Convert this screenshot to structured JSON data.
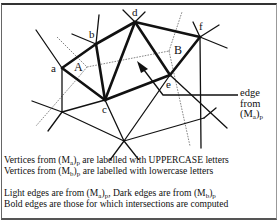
{
  "diagram": {
    "vertices_lowercase": [
      {
        "label": "a",
        "x": 62,
        "y": 68
      },
      {
        "label": "b",
        "x": 96,
        "y": 44
      },
      {
        "label": "c",
        "x": 105,
        "y": 100
      },
      {
        "label": "d",
        "x": 135,
        "y": 22
      },
      {
        "label": "e",
        "x": 170,
        "y": 75
      },
      {
        "label": "f",
        "x": 200,
        "y": 37
      }
    ],
    "vertices_uppercase": [
      {
        "label": "A",
        "x": 87,
        "y": 67
      },
      {
        "label": "B",
        "x": 169,
        "y": 51
      }
    ],
    "labels": {
      "a": "a",
      "b": "b",
      "c": "c",
      "d": "d",
      "e": "e",
      "f": "f",
      "A": "A",
      "B": "B"
    },
    "annotation": {
      "line1": "edge",
      "line2": "from",
      "line3_base": "(M",
      "line3_sub1": "a",
      "line3_close": ")",
      "line3_sub2": "p"
    }
  },
  "legend": {
    "line1": {
      "pre": "Vertices from (M",
      "sub1": "a",
      "mid": ")",
      "sub2": "p",
      "post": " are labelled with UPPERCASE letters"
    },
    "line2": {
      "pre": "Vertices from (M",
      "sub1": "b",
      "mid": ")",
      "sub2": "p",
      "post": " are labelled with lowercase letters"
    },
    "line3": {
      "pre": "Light edges are from (M",
      "sub1": "a",
      "mid": ")",
      "sub2": "p",
      "post": ", Dark edges are from (M",
      "sub3": "b",
      "mid2": ")",
      "sub4": "p"
    },
    "line4": {
      "text": "Bold edges are those for which intersections are computed"
    }
  },
  "colors": {
    "dark_edge": "#111111",
    "light_edge": "#777777",
    "frame": "#333333"
  }
}
